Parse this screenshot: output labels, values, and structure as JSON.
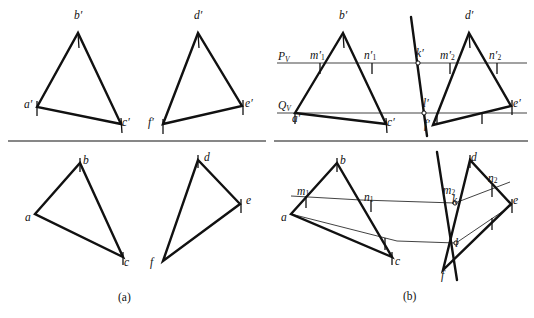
{
  "figure": {
    "panels": [
      {
        "id": "a",
        "caption": "(a)",
        "caption_x": 118,
        "caption_y": 291
      },
      {
        "id": "b",
        "caption": "(b)",
        "caption_x": 403,
        "caption_y": 290
      }
    ]
  },
  "traces": {
    "pv_label": "P",
    "pv_sub": "V",
    "qv_label": "Q",
    "qv_sub": "V",
    "pv_x": 278,
    "pv_y": 50,
    "qv_x": 278,
    "qv_y": 99
  },
  "labels": {
    "panel_a_top": [
      {
        "name": "a-prime",
        "text": "a′",
        "x": 24,
        "y": 99
      },
      {
        "name": "b-prime",
        "text": "b′",
        "x": 74,
        "y": 10
      },
      {
        "name": "c-prime",
        "text": "c′",
        "x": 122,
        "y": 117
      },
      {
        "name": "d-prime",
        "text": "d′",
        "x": 194,
        "y": 10
      },
      {
        "name": "e-prime",
        "text": "e′",
        "x": 245,
        "y": 98
      },
      {
        "name": "f-prime",
        "text": "f′",
        "x": 148,
        "y": 117
      }
    ],
    "panel_a_bottom": [
      {
        "name": "a",
        "text": "a",
        "x": 25,
        "y": 212
      },
      {
        "name": "b",
        "text": "b",
        "x": 83,
        "y": 155
      },
      {
        "name": "c",
        "text": "c",
        "x": 124,
        "y": 257
      },
      {
        "name": "d",
        "text": "d",
        "x": 204,
        "y": 152
      },
      {
        "name": "e",
        "text": "e",
        "x": 246,
        "y": 195
      },
      {
        "name": "f",
        "text": "f",
        "x": 150,
        "y": 257
      }
    ],
    "panel_b_top": [
      {
        "name": "a-prime",
        "text": "a′",
        "x": 292,
        "y": 113
      },
      {
        "name": "b-prime",
        "text": "b′",
        "x": 339,
        "y": 10
      },
      {
        "name": "c-prime",
        "text": "c′",
        "x": 387,
        "y": 117
      },
      {
        "name": "d-prime",
        "text": "d′",
        "x": 465,
        "y": 10
      },
      {
        "name": "e-prime",
        "text": "e′",
        "x": 513,
        "y": 98
      },
      {
        "name": "f-prime",
        "text": "f′",
        "x": 424,
        "y": 119
      },
      {
        "name": "m1-prime",
        "text": "m′",
        "sub": "1",
        "x": 310,
        "y": 50
      },
      {
        "name": "n1-prime",
        "text": "n′",
        "sub": "1",
        "x": 364,
        "y": 50
      },
      {
        "name": "k-prime",
        "text": "k′",
        "x": 416,
        "y": 48
      },
      {
        "name": "m2-prime",
        "text": "m′",
        "sub": "2",
        "x": 440,
        "y": 50
      },
      {
        "name": "n2-prime",
        "text": "n′",
        "sub": "2",
        "x": 489,
        "y": 50
      },
      {
        "name": "l-prime",
        "text": "l′",
        "x": 423,
        "y": 98
      }
    ],
    "panel_b_bottom": [
      {
        "name": "a",
        "text": "a",
        "x": 281,
        "y": 212
      },
      {
        "name": "b",
        "text": "b",
        "x": 340,
        "y": 155
      },
      {
        "name": "c",
        "text": "c",
        "x": 395,
        "y": 256
      },
      {
        "name": "d",
        "text": "d",
        "x": 471,
        "y": 152
      },
      {
        "name": "e",
        "text": "e",
        "x": 513,
        "y": 195
      },
      {
        "name": "f",
        "text": "f",
        "x": 441,
        "y": 270
      },
      {
        "name": "m1",
        "text": "m",
        "sub": "1",
        "x": 297,
        "y": 186
      },
      {
        "name": "n1",
        "text": "n",
        "sub": "1",
        "x": 364,
        "y": 192
      },
      {
        "name": "k",
        "text": "k",
        "x": 452,
        "y": 195
      },
      {
        "name": "m2",
        "text": "m",
        "sub": "2",
        "x": 443,
        "y": 185
      },
      {
        "name": "n2",
        "text": "n",
        "sub": "2",
        "x": 488,
        "y": 173
      },
      {
        "name": "l",
        "text": "l",
        "x": 455,
        "y": 238
      }
    ]
  },
  "geometry": {
    "stroke_thick": 2.4,
    "stroke_thin": 0.8,
    "stroke_rule": 1.1,
    "color_ink": "#111111",
    "color_rule": "#444444",
    "ground_lines": [
      {
        "name": "ground-line-left",
        "x1": 8,
        "y1": 141,
        "x2": 266,
        "y2": 141
      },
      {
        "name": "ground-line-right",
        "x1": 274,
        "y1": 141,
        "x2": 528,
        "y2": 141
      }
    ],
    "trace_lines": [
      {
        "name": "pv-trace",
        "x1": 277,
        "y1": 63,
        "x2": 527,
        "y2": 63
      },
      {
        "name": "qv-trace",
        "x1": 277,
        "y1": 113,
        "x2": 527,
        "y2": 113
      }
    ],
    "panel_a_top_triangles": [
      {
        "name": "triangle-abc-prime",
        "points": "37,107 78,33 121,124"
      },
      {
        "name": "triangle-def-prime",
        "points": "163,124 198,33 242,106"
      }
    ],
    "panel_a_bottom_triangles": [
      {
        "name": "triangle-abc",
        "points": "35,214 80,163 123,257"
      },
      {
        "name": "triangle-def",
        "points": "163,261 198,160 240,204"
      }
    ],
    "panel_b_top_triangles": [
      {
        "name": "triangle-abc-prime",
        "points": "295,113 343,33 386,124"
      },
      {
        "name": "triangle-def-prime",
        "points": "433,125 469,33 511,106"
      }
    ],
    "panel_b_bottom_triangles": [
      {
        "name": "triangle-abc",
        "points": "291,214 337,163 392,257"
      },
      {
        "name": "triangle-def",
        "points": "443,270 470,160 511,204"
      }
    ],
    "kl_lines": [
      {
        "name": "kl-line-top",
        "x1": 411,
        "y1": 17,
        "x2": 427,
        "y2": 136
      },
      {
        "name": "kl-line-bottom",
        "x1": 437,
        "y1": 152,
        "x2": 457,
        "y2": 280
      }
    ],
    "thin_polylines": [
      {
        "name": "mnk-thin-line",
        "points": "291,196 361,200 455,203 510,182"
      },
      {
        "name": "alf-thin-line",
        "points": "291,214 397,241 456,243 512,205"
      }
    ],
    "markers": [
      {
        "name": "point-marker-k-prime",
        "cx": 418,
        "cy": 63,
        "r": 2.1
      },
      {
        "name": "point-marker-l-prime",
        "cx": 424,
        "cy": 113,
        "r": 2.1
      },
      {
        "name": "point-marker-k",
        "cx": 455,
        "cy": 203,
        "r": 2.1
      },
      {
        "name": "point-marker-l",
        "cx": 456,
        "cy": 243,
        "r": 2.1
      }
    ],
    "tick_marks": [
      {
        "name": "tick-a-prime",
        "x1": 37,
        "y1": 101,
        "x2": 37,
        "y2": 116
      },
      {
        "name": "tick-b-prime",
        "x1": 78,
        "y1": 33,
        "x2": 79,
        "y2": 48
      },
      {
        "name": "tick-c-prime",
        "x1": 121,
        "y1": 118,
        "x2": 122,
        "y2": 133
      },
      {
        "name": "tick-d-prime",
        "x1": 198,
        "y1": 33,
        "x2": 199,
        "y2": 48
      },
      {
        "name": "tick-e-prime",
        "x1": 243,
        "y1": 100,
        "x2": 243,
        "y2": 115
      },
      {
        "name": "tick-f-prime",
        "x1": 163,
        "y1": 119,
        "x2": 163,
        "y2": 134
      },
      {
        "name": "tick-b",
        "x1": 80,
        "y1": 158,
        "x2": 80,
        "y2": 172
      },
      {
        "name": "tick-c",
        "x1": 123,
        "y1": 252,
        "x2": 123,
        "y2": 265
      },
      {
        "name": "tick-d",
        "x1": 198,
        "y1": 155,
        "x2": 198,
        "y2": 168
      },
      {
        "name": "tick-e",
        "x1": 241,
        "y1": 199,
        "x2": 241,
        "y2": 213
      },
      {
        "name": "tick-b2",
        "x1": 337,
        "y1": 158,
        "x2": 337,
        "y2": 172
      },
      {
        "name": "tick-c2",
        "x1": 392,
        "y1": 252,
        "x2": 392,
        "y2": 265
      },
      {
        "name": "tick-d2",
        "x1": 470,
        "y1": 155,
        "x2": 470,
        "y2": 168
      },
      {
        "name": "tick-e2",
        "x1": 512,
        "y1": 199,
        "x2": 512,
        "y2": 213
      },
      {
        "name": "tick-b-prime2",
        "x1": 343,
        "y1": 33,
        "x2": 344,
        "y2": 48
      },
      {
        "name": "tick-c-prime2",
        "x1": 386,
        "y1": 118,
        "x2": 387,
        "y2": 133
      },
      {
        "name": "tick-d-prime2",
        "x1": 469,
        "y1": 33,
        "x2": 470,
        "y2": 48
      },
      {
        "name": "tick-e-prime2",
        "x1": 512,
        "y1": 100,
        "x2": 512,
        "y2": 115
      },
      {
        "name": "tick-m1-prime",
        "x1": 320,
        "y1": 63,
        "x2": 320,
        "y2": 74
      },
      {
        "name": "tick-n1-prime",
        "x1": 372,
        "y1": 63,
        "x2": 372,
        "y2": 74
      },
      {
        "name": "tick-m2-prime",
        "x1": 450,
        "y1": 63,
        "x2": 450,
        "y2": 74
      },
      {
        "name": "tick-n2-prime",
        "x1": 497,
        "y1": 63,
        "x2": 497,
        "y2": 74
      },
      {
        "name": "tick-q-a",
        "x1": 295,
        "y1": 113,
        "x2": 295,
        "y2": 124
      },
      {
        "name": "tick-q-f",
        "x1": 437,
        "y1": 113,
        "x2": 437,
        "y2": 124
      },
      {
        "name": "tick-q-e",
        "x1": 482,
        "y1": 113,
        "x2": 482,
        "y2": 124
      },
      {
        "name": "tick-m1",
        "x1": 306,
        "y1": 196,
        "x2": 306,
        "y2": 208
      },
      {
        "name": "tick-n1",
        "x1": 371,
        "y1": 200,
        "x2": 371,
        "y2": 212
      },
      {
        "name": "tick-c-thin",
        "x1": 385,
        "y1": 238,
        "x2": 385,
        "y2": 250
      },
      {
        "name": "tick-n2b",
        "x1": 492,
        "y1": 185,
        "x2": 492,
        "y2": 197
      },
      {
        "name": "tick-ef",
        "x1": 492,
        "y1": 218,
        "x2": 492,
        "y2": 230
      }
    ]
  }
}
